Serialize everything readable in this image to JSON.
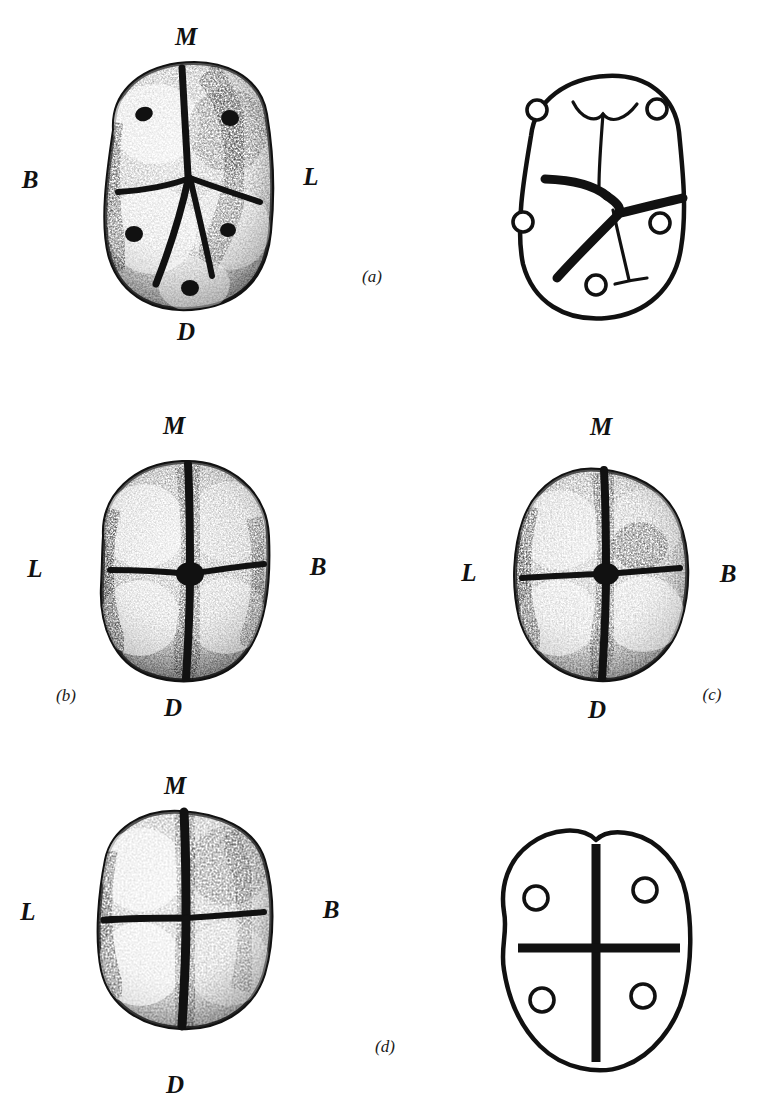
{
  "figure": {
    "kind": "scientific-plate",
    "background_color": "#ffffff",
    "ink_color": "#111111",
    "orientation_key": {
      "M": "mesial",
      "D": "distal",
      "B": "buccal",
      "L": "lingual"
    }
  },
  "panels": [
    {
      "id": "a",
      "label": "(a)",
      "label_pos": {
        "x": 372,
        "y": 276
      },
      "drawing": {
        "type": "stippled-tooth-drawing",
        "center": {
          "x": 185,
          "y": 180
        },
        "rx": 93,
        "ry": 120,
        "groove_pattern": "Y",
        "cusp_count": 5,
        "orientation_labels": [
          {
            "text": "M",
            "x": 186,
            "y": 36
          },
          {
            "text": "B",
            "x": 30,
            "y": 179
          },
          {
            "text": "L",
            "x": 311,
            "y": 176
          },
          {
            "text": "D",
            "x": 186,
            "y": 331
          }
        ]
      },
      "schematic": {
        "type": "outline-diagram",
        "center": {
          "x": 602,
          "y": 192
        },
        "rx": 97,
        "ry": 122,
        "groove_pattern": "Y",
        "cusp_count": 5,
        "cusps": [
          {
            "x": 537,
            "y": 110,
            "r": 10
          },
          {
            "x": 657,
            "y": 109,
            "r": 10
          },
          {
            "x": 523,
            "y": 222,
            "r": 10
          },
          {
            "x": 660,
            "y": 223,
            "r": 10
          },
          {
            "x": 596,
            "y": 285,
            "r": 10
          }
        ]
      }
    },
    {
      "id": "b",
      "label": "(b)",
      "label_pos": {
        "x": 66,
        "y": 695
      },
      "drawing": {
        "type": "stippled-tooth-drawing",
        "center": {
          "x": 183,
          "y": 563
        },
        "rx": 96,
        "ry": 113,
        "groove_pattern": "Y",
        "cusp_count": 5,
        "orientation_labels": [
          {
            "text": "M",
            "x": 174,
            "y": 425
          },
          {
            "text": "L",
            "x": 35,
            "y": 568
          },
          {
            "text": "B",
            "x": 318,
            "y": 566
          },
          {
            "text": "D",
            "x": 173,
            "y": 707
          }
        ]
      },
      "schematic": null
    },
    {
      "id": "c",
      "label": "(c)",
      "label_pos": {
        "x": 712,
        "y": 694
      },
      "drawing": {
        "type": "stippled-tooth-drawing",
        "center": {
          "x": 597,
          "y": 565
        },
        "rx": 94,
        "ry": 113,
        "groove_pattern": "+",
        "cusp_count": 4,
        "orientation_labels": [
          {
            "text": "M",
            "x": 601,
            "y": 426
          },
          {
            "text": "L",
            "x": 469,
            "y": 572
          },
          {
            "text": "B",
            "x": 728,
            "y": 573
          },
          {
            "text": "D",
            "x": 597,
            "y": 709
          }
        ]
      },
      "schematic": null
    },
    {
      "id": "d",
      "label": "(d)",
      "label_pos": {
        "x": 385,
        "y": 1046
      },
      "drawing": {
        "type": "stippled-tooth-drawing",
        "center": {
          "x": 182,
          "y": 910
        },
        "rx": 94,
        "ry": 114,
        "groove_pattern": "+",
        "cusp_count": 4,
        "orientation_labels": [
          {
            "text": "M",
            "x": 175,
            "y": 785
          },
          {
            "text": "L",
            "x": 28,
            "y": 911
          },
          {
            "text": "B",
            "x": 331,
            "y": 909
          },
          {
            "text": "D",
            "x": 175,
            "y": 1084
          }
        ]
      },
      "schematic": {
        "type": "outline-diagram",
        "center": {
          "x": 595,
          "y": 950
        },
        "rx": 112,
        "ry": 125,
        "groove_pattern": "+",
        "cusp_count": 4,
        "cusps": [
          {
            "x": 516,
            "y": 894,
            "r": 12
          },
          {
            "x": 670,
            "y": 882,
            "r": 12
          },
          {
            "x": 522,
            "y": 1003,
            "r": 12
          },
          {
            "x": 668,
            "y": 999,
            "r": 12
          }
        ]
      }
    }
  ]
}
